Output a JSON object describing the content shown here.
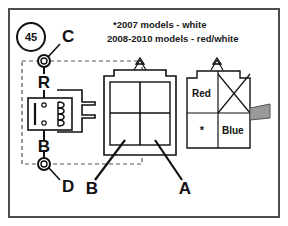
{
  "diagram": {
    "badge": {
      "number": "45"
    },
    "notes": [
      "*2007 models - white",
      "2008-2010 models - red/white"
    ],
    "terminals": [
      {
        "id": "top",
        "label": "C"
      },
      {
        "id": "bottom",
        "label": "D"
      }
    ],
    "relay": {
      "top_pin_label": "R",
      "bottom_pin_label": "B"
    },
    "callouts": [
      {
        "id": "b-callout",
        "label": "B"
      },
      {
        "id": "a-callout",
        "label": "A"
      }
    ],
    "connector_right": {
      "cells": [
        {
          "id": "top-left",
          "label": "Red"
        },
        {
          "id": "top-right",
          "label": ""
        },
        {
          "id": "bottom-left",
          "label": "*"
        },
        {
          "id": "bottom-right",
          "label": "Blue"
        }
      ]
    },
    "colors": {
      "line": "#1a1a1a",
      "frame": "#4d4d4d",
      "dashed": "#555555",
      "tab_fill": "#9a9a9a",
      "background": "#ffffff"
    }
  }
}
